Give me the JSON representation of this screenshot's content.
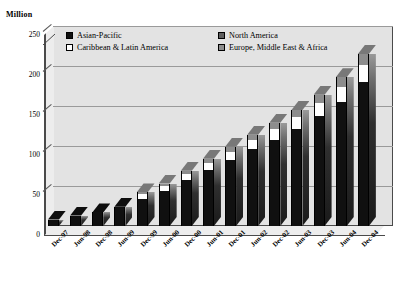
{
  "chart_data": {
    "type": "bar",
    "subtype": "stacked-column-3d",
    "title": "",
    "xlabel": "",
    "ylabel": "Million",
    "ylim": [
      0,
      250
    ],
    "yticks": [
      0,
      50,
      100,
      150,
      200,
      250
    ],
    "ytick_labels": [
      "0",
      "50",
      "100",
      "150",
      "200",
      "250"
    ],
    "grid": true,
    "legend_position": "top-inside",
    "categories": [
      "Dec-97",
      "Jun-98",
      "Dec-98",
      "Jun-99",
      "Dec-99",
      "Jun-00",
      "Dec-00",
      "Jun-01",
      "Dec-01",
      "Jun-02",
      "Dec-02",
      "Jun-03",
      "Dec-03",
      "Jun-04",
      "Dec-04"
    ],
    "series": [
      {
        "name": "Asian-Pacific",
        "color": "#101010",
        "values": [
          8,
          13,
          17,
          24,
          34,
          44,
          57,
          70,
          83,
          96,
          108,
          121,
          137,
          155,
          180
        ]
      },
      {
        "name": "Caribbean & Latin America",
        "color": "#ffffff",
        "values": [
          0,
          0,
          0,
          0,
          6,
          6,
          8,
          9,
          10,
          11,
          13,
          15,
          17,
          19,
          21
        ]
      },
      {
        "name": "North America",
        "color": "#5e5e5e",
        "values": [
          0,
          0,
          0,
          0,
          0,
          0,
          0,
          0,
          0,
          0,
          0,
          0,
          0,
          0,
          0
        ]
      },
      {
        "name": "Europe, Middle East & Africa",
        "color": "#8d8d8d",
        "values": [
          0,
          0,
          0,
          0,
          2,
          3,
          4,
          5,
          6,
          7,
          8,
          9,
          10,
          12,
          14
        ]
      }
    ],
    "totals": [
      8,
      13,
      17,
      24,
      42,
      53,
      69,
      84,
      99,
      114,
      129,
      145,
      164,
      186,
      215
    ]
  },
  "legend": {
    "items": [
      {
        "label": "Asian-Pacific",
        "swatch": "sw-ap"
      },
      {
        "label": "North America",
        "swatch": "sw-na"
      },
      {
        "label": "Caribbean & Latin America",
        "swatch": "sw-cla"
      },
      {
        "label": "Europe, Middle East & Africa",
        "swatch": "sw-emea"
      }
    ]
  }
}
